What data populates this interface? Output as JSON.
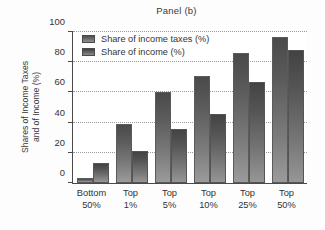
{
  "chart_data": {
    "type": "bar",
    "title": "Panel (b)",
    "xlabel": "",
    "ylabel": "Shares of Income Taxes and of Income (%)",
    "ylabel_line1": "Shares of Income Taxes",
    "ylabel_line2": "and of Income (%)",
    "ylim": [
      0,
      100
    ],
    "yticks": [
      0,
      20,
      40,
      60,
      80,
      100
    ],
    "ytick_labels": [
      "0",
      "20",
      "40",
      "60",
      "80",
      "100"
    ],
    "grid": true,
    "grid_axis": "y",
    "legend_position": "upper left",
    "categories": [
      "Bottom 50%",
      "Top 1%",
      "Top 5%",
      "Top 10%",
      "Top 25%",
      "Top 50%"
    ],
    "category_lines": [
      {
        "line1": "Bottom",
        "line2": "50%"
      },
      {
        "line1": "Top",
        "line2": "1%"
      },
      {
        "line1": "Top",
        "line2": "5%"
      },
      {
        "line1": "Top",
        "line2": "10%"
      },
      {
        "line1": "Top",
        "line2": "25%"
      },
      {
        "line1": "Top",
        "line2": "50%"
      }
    ],
    "series": [
      {
        "name": "Share of income taxes (%)",
        "color": "#5c5c5c",
        "values": [
          3,
          39,
          60,
          71,
          86,
          97
        ]
      },
      {
        "name": "Share of income (%)",
        "color": "#565656",
        "values": [
          13,
          21,
          36,
          46,
          67,
          88
        ]
      }
    ]
  },
  "legend": {
    "items": [
      {
        "label": "Share of income taxes (%)"
      },
      {
        "label": "Share of income (%)"
      }
    ]
  }
}
